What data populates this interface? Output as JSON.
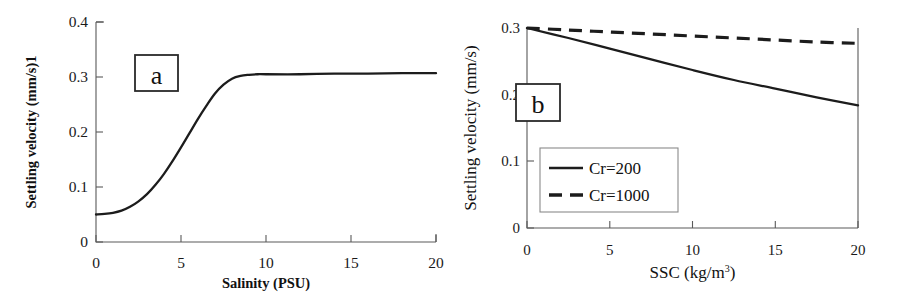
{
  "figure": {
    "background_color": "#ffffff",
    "line_color": "#1c1c1c",
    "axis_color": "#5a5a5a"
  },
  "chart_data": [
    {
      "type": "line",
      "panel_label": "a",
      "title": "",
      "xlabel": "Salinity (PSU)",
      "ylabel": "Settling velocity (mm/s)1",
      "xlim": [
        0,
        20
      ],
      "ylim": [
        0,
        0.4
      ],
      "xticks": [
        "0",
        "5",
        "10",
        "15",
        "20"
      ],
      "xtick_values": [
        0,
        5,
        10,
        15,
        20
      ],
      "yticks": [
        "0",
        "0.1",
        "0.2",
        "0.3",
        "0.4"
      ],
      "ytick_values": [
        0,
        0.1,
        0.2,
        0.3,
        0.4
      ],
      "grid": false,
      "legend": false,
      "series": [
        {
          "name": "settling-velocity-vs-salinity",
          "style": "solid",
          "x": [
            0,
            0.5,
            1,
            1.5,
            2,
            2.5,
            3,
            3.5,
            4,
            4.5,
            5,
            5.5,
            6,
            6.5,
            7,
            7.5,
            8,
            8.5,
            9,
            9.5,
            10,
            12,
            14,
            16,
            18,
            20
          ],
          "y": [
            0.05,
            0.051,
            0.053,
            0.057,
            0.064,
            0.074,
            0.087,
            0.104,
            0.124,
            0.147,
            0.172,
            0.198,
            0.224,
            0.248,
            0.27,
            0.286,
            0.297,
            0.302,
            0.304,
            0.305,
            0.305,
            0.305,
            0.306,
            0.306,
            0.307,
            0.307
          ]
        }
      ]
    },
    {
      "type": "line",
      "panel_label": "b",
      "title": "",
      "xlabel": "SSC (kg/m",
      "xlabel_sup": "3",
      "xlabel_tail": ")",
      "ylabel": "Settling velocity (mm/s)",
      "xlim": [
        0,
        20
      ],
      "ylim": [
        0,
        0.3
      ],
      "xticks": [
        "0",
        "5",
        "10",
        "15",
        "20"
      ],
      "xtick_values": [
        0,
        5,
        10,
        15,
        20
      ],
      "yticks": [
        "0",
        "0.1",
        "0.2",
        "0.3"
      ],
      "ytick_values": [
        0,
        0.1,
        0.2,
        0.3
      ],
      "grid": false,
      "legend": true,
      "legend_position": "lower-left",
      "series": [
        {
          "name": "Cr=200",
          "style": "solid",
          "x": [
            0,
            2.5,
            5,
            7.5,
            10,
            12.5,
            15,
            17.5,
            20
          ],
          "y": [
            0.3,
            0.285,
            0.269,
            0.253,
            0.237,
            0.222,
            0.209,
            0.196,
            0.184
          ]
        },
        {
          "name": "Cr=1000",
          "style": "dashed",
          "x": [
            0,
            2.5,
            5,
            7.5,
            10,
            12.5,
            15,
            17.5,
            20
          ],
          "y": [
            0.3,
            0.297,
            0.294,
            0.291,
            0.288,
            0.285,
            0.282,
            0.279,
            0.277
          ]
        }
      ],
      "legend_entries": [
        {
          "label": "Cr=200",
          "style": "solid"
        },
        {
          "label": "Cr=1000",
          "style": "dashed"
        }
      ]
    }
  ]
}
